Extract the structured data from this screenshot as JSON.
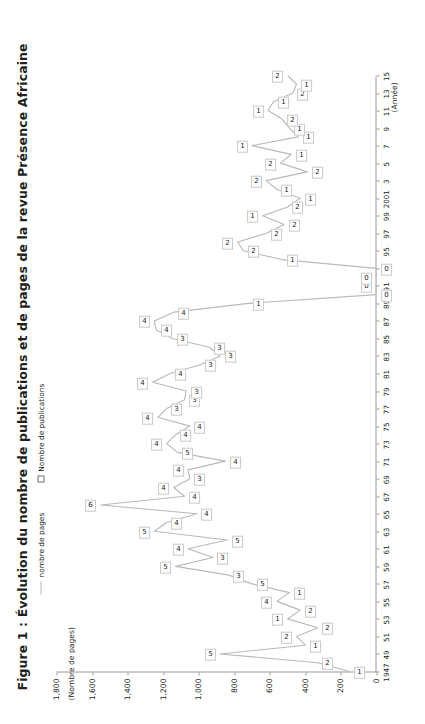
{
  "figure": {
    "title": "Figure 1 : Évolution du nombre de publications et de pages de la revue Présence Africaine",
    "y_axis_caption": "(Nombre de pages)",
    "x_axis_caption": "(Année)"
  },
  "legend": {
    "position": "top",
    "items": [
      {
        "label": "nombre de pages",
        "marker": "line-swatch",
        "color": "#b9b9b9"
      },
      {
        "label": "Nombre de publications",
        "marker": "square-swatch",
        "color": "#6f6f6f"
      }
    ]
  },
  "chart_data": {
    "type": "line",
    "title": "Figure 1 : Évolution du nombre de publications et de pages de la revue Présence Africaine",
    "subtitle": "",
    "xlabel": "(Année)",
    "ylabel": "(Nombre de pages)",
    "ylim": [
      0,
      1800
    ],
    "ytick_labels": [
      "0",
      "200",
      "400",
      "600",
      "800",
      "1,000",
      "1,200",
      "1,400",
      "1,600",
      "1,800"
    ],
    "ytick_values": [
      0,
      200,
      400,
      600,
      800,
      1000,
      1200,
      1400,
      1600,
      1800
    ],
    "xtick_labels": [
      "1947",
      "49",
      "51",
      "53",
      "55",
      "57",
      "59",
      "61",
      "63",
      "65",
      "67",
      "69",
      "71",
      "73",
      "75",
      "77",
      "79",
      "81",
      "83",
      "85",
      "87",
      "89",
      "91",
      "93",
      "95",
      "97",
      "99",
      "2001",
      "3",
      "5",
      "7",
      "9",
      "11",
      "13",
      "15"
    ],
    "grid": false,
    "legend_position": "top",
    "orientation": "rotated-90",
    "x": [
      1947,
      1948,
      1949,
      1950,
      1951,
      1952,
      1953,
      1954,
      1955,
      1956,
      1957,
      1958,
      1959,
      1960,
      1961,
      1962,
      1963,
      1964,
      1965,
      1966,
      1967,
      1968,
      1969,
      1970,
      1971,
      1972,
      1973,
      1974,
      1975,
      1976,
      1977,
      1978,
      1979,
      1980,
      1981,
      1982,
      1983,
      1984,
      1985,
      1986,
      1987,
      1988,
      1989,
      1990,
      1991,
      1992,
      1993,
      1994,
      1995,
      1996,
      1997,
      1998,
      1999,
      2000,
      2001,
      2002,
      2003,
      2004,
      2005,
      2006,
      2007,
      2008,
      2009,
      2010,
      2011,
      2012,
      2013,
      2014,
      2015
    ],
    "series": [
      {
        "name": "nombre de pages",
        "kind": "line",
        "color": "#b9b9b9",
        "values": [
          150,
          330,
          880,
          400,
          450,
          330,
          500,
          430,
          560,
          490,
          700,
          830,
          1130,
          920,
          1060,
          840,
          1250,
          1180,
          1010,
          1550,
          1080,
          1140,
          1050,
          1060,
          850,
          1120,
          1180,
          1130,
          1050,
          1230,
          1180,
          1080,
          1070,
          1260,
          1160,
          990,
          880,
          940,
          1150,
          1240,
          1250,
          1140,
          720,
          0,
          0,
          0,
          0,
          530,
          750,
          780,
          620,
          520,
          640,
          500,
          430,
          560,
          620,
          390,
          540,
          480,
          700,
          440,
          490,
          530,
          610,
          580,
          470,
          450,
          500
        ]
      },
      {
        "name": "Nombre de publications",
        "kind": "point-label",
        "color": "#6f6f6f",
        "values": [
          1,
          2,
          5,
          1,
          2,
          2,
          1,
          2,
          4,
          1,
          5,
          3,
          5,
          3,
          4,
          5,
          5,
          4,
          4,
          6,
          4,
          4,
          3,
          4,
          4,
          5,
          4,
          4,
          4,
          4,
          3,
          3,
          3,
          4,
          4,
          3,
          3,
          3,
          3,
          4,
          4,
          4,
          1,
          0,
          0,
          0,
          0,
          1,
          2,
          2,
          2,
          2,
          1,
          2,
          1,
          1,
          2,
          2,
          2,
          1,
          1,
          1,
          1,
          2,
          1,
          1,
          2,
          1,
          2
        ]
      }
    ]
  }
}
